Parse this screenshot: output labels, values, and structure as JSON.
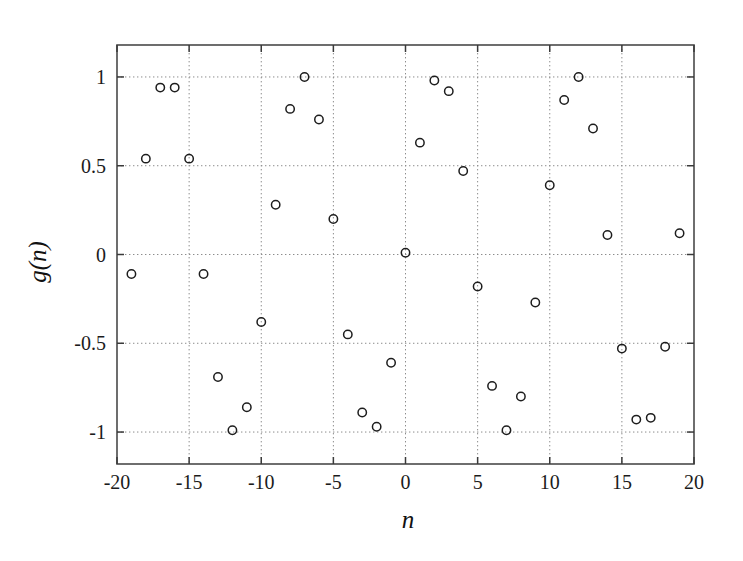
{
  "figure": {
    "background_color": "#ffffff",
    "frame_color": "#4a4a4a",
    "grid_color": "#8c8c8c",
    "marker_color": "#1d1d1d",
    "marker_shape": "open-circle",
    "marker_radius_px": 4.2
  },
  "chart_data": {
    "type": "scatter",
    "title": "",
    "xlabel": "n",
    "ylabel": "g(n)",
    "xlim": [
      -20,
      20
    ],
    "ylim": [
      -1.18,
      1.18
    ],
    "xticks": [
      -20,
      -15,
      -10,
      -5,
      0,
      5,
      10,
      15,
      20
    ],
    "xtick_labels": [
      "-20",
      "-15",
      "-10",
      "-5",
      "0",
      "5",
      "10",
      "15",
      "20"
    ],
    "yticks": [
      -1,
      -0.5,
      0,
      0.5,
      1
    ],
    "ytick_labels": [
      "-1",
      "-0.5",
      "0",
      "0.5",
      "1"
    ],
    "grid": true,
    "grid_style": "dotted",
    "legend": null,
    "series": [
      {
        "name": "g(n)",
        "x": [
          -19,
          -18,
          -17,
          -16,
          -15,
          -14,
          -13,
          -12,
          -11,
          -10,
          -9,
          -8,
          -7,
          -6,
          -5,
          -4,
          -3,
          -2,
          -1,
          0,
          1,
          2,
          3,
          4,
          5,
          6,
          7,
          8,
          9,
          10,
          11,
          12,
          13,
          14,
          15,
          16,
          17,
          18,
          19
        ],
        "y": [
          -0.11,
          0.54,
          0.94,
          0.94,
          0.54,
          -0.11,
          -0.69,
          -0.99,
          -0.86,
          -0.38,
          0.28,
          0.82,
          1.0,
          0.76,
          0.2,
          -0.45,
          -0.89,
          -0.97,
          -0.61,
          0.01,
          0.63,
          0.98,
          0.92,
          0.47,
          -0.18,
          -0.74,
          -0.99,
          -0.8,
          -0.27,
          0.39,
          0.87,
          1.0,
          0.71,
          0.11,
          -0.53,
          -0.93,
          -0.92,
          -0.52,
          0.12
        ]
      }
    ]
  }
}
